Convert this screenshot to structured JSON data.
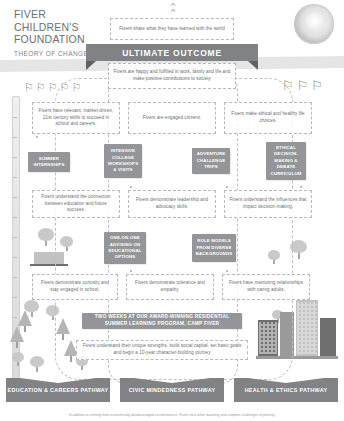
{
  "brand": {
    "line1": "FIVER",
    "line2": "CHILDREN'S",
    "line3": "FOUNDATION",
    "subtitle": "THEORY OF CHANGE"
  },
  "colors": {
    "chip_fill": "#939598",
    "ribbon_fill": "#808285",
    "pathway_fill": "#808285",
    "text": "#6d6e71",
    "dashed_border": "#b9b9b9",
    "background": "#ffffff"
  },
  "top": {
    "share_text": "Fivers share what they have learned with the world",
    "ribbon_label": "ULTIMATE OUTCOME",
    "ultimate_text": "Fivers are happy and fulfilled in work, family and life and make positive contributions to society"
  },
  "rows": {
    "outcomes_1": [
      {
        "text": "Fivers have relevant, market-driven, 21st century skills to succeed in school and careers."
      },
      {
        "text": "Fivers are engaged citizens."
      },
      {
        "text": "Fivers make ethical and healthy life choices."
      }
    ],
    "programs_1": [
      {
        "label": "SUMMER INTERNSHIPS"
      },
      {
        "label": "INTENSIVE COLLEGE WORKSHOPS & VISITS"
      },
      {
        "label": "ADVENTURE CHALLENGE TRIPS"
      },
      {
        "label": "ETHICAL DECISION-MAKING & DEBATE CURRICULUM"
      }
    ],
    "outcomes_2": [
      {
        "text": "Fivers understand the connection between education and future success."
      },
      {
        "text": "Fivers demonstrate leadership and advocacy skills."
      },
      {
        "text": "Fivers understand the influences that impact decision-making."
      }
    ],
    "programs_2": [
      {
        "label": "ONE-ON-ONE ADVISING ON EDUCATIONAL OPTIONS"
      },
      {
        "label": "ROLE MODELS FROM DIVERSE BACKGROUNDS"
      }
    ],
    "outcomes_3": [
      {
        "text": "Fivers demonstrate curiosity and stay engaged in school."
      },
      {
        "text": "Fivers demonstrate tolerance and empathy."
      },
      {
        "text": "Fivers have mentoring relationships with caring adults."
      }
    ],
    "camp_banner": "TWO WEEKS AT OUR AWARD-WINNING RESIDENTIAL SUMMER LEARNING PROGRAM, CAMP FIVER",
    "foundation_text": "Fivers understand their unique strengths, build social capital, set basic goals and begin a 10-year character-building journey"
  },
  "pathways": [
    {
      "label": "EDUCATION & CAREERS PATHWAY"
    },
    {
      "label": "CIVIC MINDEDNESS PATHWAY"
    },
    {
      "label": "HEALTH & ETHICS PATHWAY"
    }
  ],
  "footnote": "In addition to coming from economically disadvantaged circumstances, Fivers face other daunting and complex challenges of poverty.",
  "icons": {
    "chevron_up": "chevron-up-icon",
    "sun": "sun-icon"
  }
}
